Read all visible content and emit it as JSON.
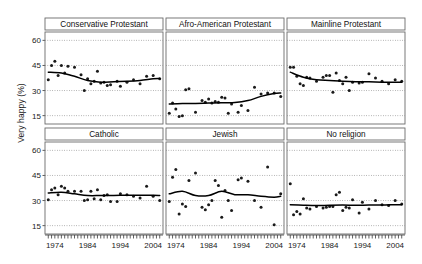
{
  "figure": {
    "ylabel": "Very happy (%)",
    "yticks": [
      60,
      45,
      30,
      15
    ],
    "xticks": [
      1974,
      1984,
      1994,
      2004
    ],
    "xlim": [
      1971,
      2007
    ],
    "ylim": [
      10,
      65
    ],
    "caption": ""
  },
  "chart_data": {
    "type": "scatter",
    "title": "",
    "xlabel": "",
    "ylabel": "Very happy (%)",
    "xlim": [
      1971,
      2007
    ],
    "ylim": [
      10,
      65
    ],
    "grid": true,
    "legend": "none",
    "layout": "trellis 2 rows x 3 columns",
    "yticks": [
      15,
      30,
      45,
      60
    ],
    "xticks": [
      1974,
      1984,
      1994,
      2004
    ],
    "annotations": [
      "Each panel shows yearly survey points with a LOWESS smoothing curve"
    ],
    "panels": [
      {
        "name": "Conservative Protestant",
        "row": 0,
        "col": 0,
        "x": [
          1972,
          1973,
          1974,
          1975,
          1976,
          1977,
          1978,
          1980,
          1982,
          1983,
          1984,
          1985,
          1986,
          1987,
          1988,
          1989,
          1990,
          1991,
          1993,
          1994,
          1996,
          1998,
          2000,
          2002,
          2004,
          2006
        ],
        "y": [
          36.5,
          45.0,
          47.5,
          39.0,
          45.0,
          40.5,
          44.5,
          44.0,
          39.5,
          30.0,
          37.0,
          34.0,
          35.5,
          41.5,
          34.5,
          35.0,
          33.0,
          33.5,
          35.5,
          32.5,
          35.0,
          36.5,
          34.0,
          38.5,
          39.0,
          37.0
        ],
        "smooth_x": [
          1972,
          1976,
          1980,
          1984,
          1988,
          1992,
          1996,
          2000,
          2004,
          2006
        ],
        "smooth_y": [
          41.0,
          40.5,
          38.5,
          36.0,
          35.0,
          35.3,
          35.5,
          36.0,
          37.0,
          37.2
        ]
      },
      {
        "name": "Afro-American Protestant",
        "row": 0,
        "col": 1,
        "x": [
          1972,
          1973,
          1974,
          1975,
          1976,
          1977,
          1978,
          1980,
          1982,
          1983,
          1984,
          1985,
          1986,
          1987,
          1988,
          1989,
          1990,
          1991,
          1993,
          1994,
          1996,
          1998,
          2000,
          2002,
          2004,
          2006
        ],
        "y": [
          16.5,
          22.5,
          19.0,
          14.5,
          15.0,
          30.5,
          31.0,
          17.0,
          24.0,
          23.0,
          25.0,
          22.5,
          23.5,
          23.0,
          26.0,
          25.5,
          16.5,
          22.0,
          17.0,
          21.0,
          18.0,
          32.0,
          28.0,
          28.5,
          28.5,
          26.5
        ],
        "smooth_x": [
          1972,
          1976,
          1980,
          1984,
          1988,
          1992,
          1996,
          2000,
          2004,
          2006
        ],
        "smooth_y": [
          22.0,
          22.2,
          22.3,
          22.5,
          22.7,
          22.8,
          24.0,
          26.5,
          28.2,
          28.5
        ]
      },
      {
        "name": "Mainline Protestant",
        "row": 0,
        "col": 2,
        "x": [
          1972,
          1973,
          1974,
          1975,
          1976,
          1977,
          1978,
          1980,
          1982,
          1983,
          1984,
          1985,
          1986,
          1987,
          1988,
          1989,
          1990,
          1991,
          1993,
          1994,
          1996,
          1998,
          2000,
          2002,
          2004,
          2006
        ],
        "y": [
          44.0,
          44.0,
          38.5,
          34.0,
          33.0,
          38.0,
          37.5,
          35.5,
          38.0,
          39.0,
          39.0,
          29.0,
          40.5,
          36.0,
          34.0,
          38.0,
          30.0,
          35.0,
          34.5,
          35.0,
          40.0,
          37.5,
          35.5,
          34.0,
          36.5,
          35.5
        ],
        "smooth_x": [
          1972,
          1976,
          1980,
          1984,
          1988,
          1992,
          1996,
          2000,
          2004,
          2006
        ],
        "smooth_y": [
          41.0,
          38.0,
          36.5,
          36.0,
          35.5,
          35.2,
          35.2,
          35.0,
          35.0,
          35.0
        ]
      },
      {
        "name": "Catholic",
        "row": 1,
        "col": 0,
        "x": [
          1972,
          1973,
          1974,
          1975,
          1976,
          1977,
          1978,
          1980,
          1982,
          1983,
          1984,
          1985,
          1986,
          1987,
          1988,
          1989,
          1990,
          1991,
          1993,
          1994,
          1996,
          1998,
          2000,
          2002,
          2004,
          2006
        ],
        "y": [
          30.5,
          36.5,
          37.5,
          33.5,
          38.5,
          37.5,
          35.5,
          35.5,
          35.5,
          30.0,
          30.5,
          35.5,
          31.0,
          36.5,
          30.5,
          33.0,
          33.5,
          29.5,
          29.5,
          34.0,
          33.5,
          32.5,
          31.5,
          38.5,
          32.5,
          30.0
        ],
        "smooth_x": [
          1972,
          1976,
          1980,
          1984,
          1988,
          1992,
          1996,
          2000,
          2004,
          2006
        ],
        "smooth_y": [
          34.5,
          35.0,
          34.0,
          33.0,
          33.0,
          33.0,
          33.2,
          33.2,
          33.2,
          33.0
        ]
      },
      {
        "name": "Jewish",
        "row": 1,
        "col": 1,
        "x": [
          1972,
          1973,
          1974,
          1975,
          1976,
          1977,
          1978,
          1980,
          1982,
          1983,
          1984,
          1985,
          1986,
          1987,
          1988,
          1989,
          1990,
          1991,
          1993,
          1994,
          1996,
          1998,
          2000,
          2002,
          2004,
          2006
        ],
        "y": [
          29.5,
          44.0,
          48.5,
          22.0,
          28.0,
          26.5,
          42.0,
          46.5,
          26.0,
          24.5,
          27.5,
          30.0,
          42.0,
          39.0,
          20.0,
          36.0,
          30.0,
          24.0,
          42.5,
          43.5,
          41.5,
          30.0,
          26.0,
          50.0,
          15.5,
          34.0
        ],
        "smooth_x": [
          1972,
          1976,
          1980,
          1984,
          1988,
          1992,
          1996,
          2000,
          2004,
          2006
        ],
        "smooth_y": [
          34.0,
          35.5,
          33.0,
          33.0,
          35.5,
          33.5,
          33.5,
          32.5,
          32.0,
          32.5
        ]
      },
      {
        "name": "No religion",
        "row": 1,
        "col": 2,
        "x": [
          1972,
          1973,
          1974,
          1975,
          1976,
          1977,
          1978,
          1980,
          1982,
          1983,
          1984,
          1985,
          1986,
          1987,
          1988,
          1989,
          1990,
          1991,
          1993,
          1994,
          1996,
          1998,
          2000,
          2002,
          2004,
          2006
        ],
        "y": [
          40.0,
          21.5,
          23.5,
          22.0,
          31.0,
          25.5,
          25.0,
          26.5,
          25.5,
          26.0,
          26.5,
          26.5,
          33.5,
          35.0,
          24.0,
          26.0,
          25.5,
          30.5,
          22.5,
          29.0,
          25.0,
          30.0,
          27.5,
          27.0,
          30.0,
          28.0
        ],
        "smooth_x": [
          1972,
          1976,
          1980,
          1984,
          1988,
          1992,
          1996,
          2000,
          2004,
          2006
        ],
        "smooth_y": [
          27.5,
          27.2,
          27.0,
          27.2,
          27.3,
          27.2,
          27.3,
          27.3,
          27.5,
          27.5
        ]
      }
    ]
  }
}
